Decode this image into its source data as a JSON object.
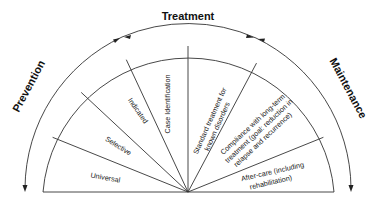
{
  "diagram": {
    "type": "semicircular-spectrum",
    "phases": {
      "left": "Prevention",
      "top": "Treatment",
      "right": "Maintenance"
    },
    "segments": [
      {
        "id": "universal",
        "lines": [
          "Universal"
        ],
        "group": "Prevention"
      },
      {
        "id": "selective",
        "lines": [
          "Selective"
        ],
        "group": "Prevention"
      },
      {
        "id": "indicated",
        "lines": [
          "Indicated"
        ],
        "group": "Prevention"
      },
      {
        "id": "case-identification",
        "lines": [
          "Case Identification"
        ],
        "group": "Treatment"
      },
      {
        "id": "standard-treatment",
        "lines": [
          "Standard treatment for",
          "known disorders"
        ],
        "group": "Treatment"
      },
      {
        "id": "compliance",
        "lines": [
          "Compliance with long-term",
          "treatment (goal: reduction in",
          "relapse and recurrence)"
        ],
        "group": "Maintenance"
      },
      {
        "id": "after-care",
        "lines": [
          "After-care (including",
          "rehabilitation)"
        ],
        "group": "Maintenance"
      }
    ],
    "colors": {
      "line": "#333333",
      "text": "#222222",
      "background": "#ffffff"
    }
  }
}
